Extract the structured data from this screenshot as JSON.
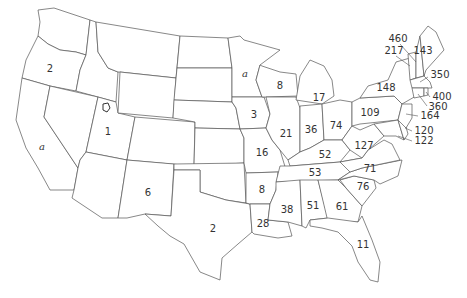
{
  "map": {
    "title": "",
    "colors": {
      "background": "#ffffff",
      "stroke": "#555555",
      "text": "#333333"
    },
    "labels": [
      {
        "id": "oregon",
        "text": "2",
        "x": 50,
        "y": 69
      },
      {
        "id": "california",
        "text": "a",
        "x": 42,
        "y": 147,
        "italic": true
      },
      {
        "id": "utah",
        "text": "1",
        "x": 108,
        "y": 132
      },
      {
        "id": "new-mexico",
        "text": "6",
        "x": 148,
        "y": 193
      },
      {
        "id": "texas",
        "text": "2",
        "x": 213,
        "y": 229
      },
      {
        "id": "minnesota",
        "text": "a",
        "x": 245,
        "y": 74,
        "italic": true
      },
      {
        "id": "wisconsin",
        "text": "8",
        "x": 280,
        "y": 86
      },
      {
        "id": "iowa",
        "text": "3",
        "x": 254,
        "y": 115
      },
      {
        "id": "michigan",
        "text": "17",
        "x": 319,
        "y": 98
      },
      {
        "id": "illinois",
        "text": "21",
        "x": 286,
        "y": 134
      },
      {
        "id": "indiana",
        "text": "36",
        "x": 311,
        "y": 130
      },
      {
        "id": "ohio",
        "text": "74",
        "x": 336,
        "y": 126
      },
      {
        "id": "pennsylvania",
        "text": "109",
        "x": 370,
        "y": 113
      },
      {
        "id": "new-york",
        "text": "148",
        "x": 386,
        "y": 88
      },
      {
        "id": "vermont",
        "text": "217",
        "x": 394,
        "y": 51
      },
      {
        "id": "new-hampshire",
        "text": "460",
        "x": 398,
        "y": 39
      },
      {
        "id": "maine",
        "text": "143",
        "x": 423,
        "y": 51
      },
      {
        "id": "massachusetts",
        "text": "350",
        "x": 440,
        "y": 75
      },
      {
        "id": "rhode-island",
        "text": "400",
        "x": 442,
        "y": 97
      },
      {
        "id": "connecticut",
        "text": "360",
        "x": 438,
        "y": 107
      },
      {
        "id": "new-jersey",
        "text": "164",
        "x": 430,
        "y": 116
      },
      {
        "id": "delaware",
        "text": "120",
        "x": 424,
        "y": 131
      },
      {
        "id": "maryland",
        "text": "122",
        "x": 424,
        "y": 141
      },
      {
        "id": "missouri",
        "text": "16",
        "x": 262,
        "y": 153
      },
      {
        "id": "kentucky",
        "text": "52",
        "x": 325,
        "y": 155
      },
      {
        "id": "west-virginia",
        "text": "127",
        "x": 364,
        "y": 146
      },
      {
        "id": "virginia",
        "text": "71",
        "x": 370,
        "y": 169
      },
      {
        "id": "tennessee",
        "text": "53",
        "x": 315,
        "y": 173
      },
      {
        "id": "north-carolina",
        "text": "76",
        "x": 363,
        "y": 187
      },
      {
        "id": "arkansas",
        "text": "8",
        "x": 262,
        "y": 190
      },
      {
        "id": "mississippi",
        "text": "38",
        "x": 287,
        "y": 210
      },
      {
        "id": "alabama",
        "text": "51",
        "x": 313,
        "y": 206
      },
      {
        "id": "georgia",
        "text": "61",
        "x": 342,
        "y": 207
      },
      {
        "id": "louisiana",
        "text": "28",
        "x": 263,
        "y": 224
      },
      {
        "id": "florida",
        "text": "11",
        "x": 363,
        "y": 245
      }
    ]
  }
}
